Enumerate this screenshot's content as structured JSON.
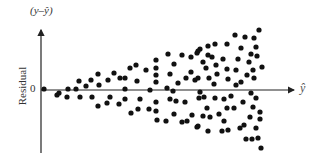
{
  "chart_data": {
    "type": "scatter",
    "title": "",
    "xlabel": "ŷ",
    "ylabel": "Residual",
    "ylabel_top": "(y–ŷ)",
    "y_tick_labels": [
      "0"
    ],
    "grid": false,
    "legend": null,
    "annotation": "Residuals fan out (increasing spread) as ŷ increases — heteroscedasticity pattern",
    "pixel_frame": {
      "x_axis_y": 90,
      "y_axis_x": 41,
      "x_end": 296,
      "y_top": 28,
      "y_bottom": 153
    },
    "points_px": [
      [
        44,
        89
      ],
      [
        57,
        95
      ],
      [
        59,
        93
      ],
      [
        68,
        89
      ],
      [
        67,
        97
      ],
      [
        76,
        89
      ],
      [
        79,
        81
      ],
      [
        80,
        97
      ],
      [
        86,
        86
      ],
      [
        91,
        80
      ],
      [
        92,
        97
      ],
      [
        98,
        74
      ],
      [
        99,
        85
      ],
      [
        98,
        106
      ],
      [
        108,
        80
      ],
      [
        110,
        97
      ],
      [
        107,
        103
      ],
      [
        114,
        73
      ],
      [
        120,
        78
      ],
      [
        125,
        78
      ],
      [
        119,
        104
      ],
      [
        125,
        89
      ],
      [
        125,
        99
      ],
      [
        130,
        68
      ],
      [
        136,
        65
      ],
      [
        137,
        81
      ],
      [
        138,
        109
      ],
      [
        131,
        113
      ],
      [
        140,
        99
      ],
      [
        146,
        70
      ],
      [
        149,
        109
      ],
      [
        150,
        90
      ],
      [
        156,
        60
      ],
      [
        156,
        68
      ],
      [
        156,
        75
      ],
      [
        156,
        82
      ],
      [
        168,
        54
      ],
      [
        174,
        64
      ],
      [
        170,
        74
      ],
      [
        178,
        83
      ],
      [
        182,
        55
      ],
      [
        186,
        78
      ],
      [
        191,
        57
      ],
      [
        191,
        72
      ],
      [
        197,
        53
      ],
      [
        200,
        49
      ],
      [
        195,
        80
      ],
      [
        167,
        88
      ],
      [
        173,
        91
      ],
      [
        156,
        102
      ],
      [
        156,
        111
      ],
      [
        157,
        120
      ],
      [
        170,
        99
      ],
      [
        176,
        101
      ],
      [
        185,
        102
      ],
      [
        199,
        98
      ],
      [
        174,
        114
      ],
      [
        166,
        121
      ],
      [
        182,
        122
      ],
      [
        187,
        121
      ],
      [
        192,
        115
      ],
      [
        197,
        127
      ],
      [
        235,
        35
      ],
      [
        208,
        46
      ],
      [
        215,
        44
      ],
      [
        227,
        44
      ],
      [
        198,
        51
      ],
      [
        208,
        55
      ],
      [
        212,
        57
      ],
      [
        223,
        59
      ],
      [
        238,
        59
      ],
      [
        203,
        62
      ],
      [
        216,
        65
      ],
      [
        206,
        68
      ],
      [
        227,
        69
      ],
      [
        236,
        70
      ],
      [
        198,
        78
      ],
      [
        209,
        78
      ],
      [
        217,
        74
      ],
      [
        228,
        79
      ],
      [
        214,
        84
      ],
      [
        236,
        85
      ],
      [
        200,
        92
      ],
      [
        204,
        97
      ],
      [
        215,
        98
      ],
      [
        224,
        99
      ],
      [
        231,
        96
      ],
      [
        207,
        108
      ],
      [
        227,
        108
      ],
      [
        234,
        108
      ],
      [
        203,
        116
      ],
      [
        210,
        117
      ],
      [
        219,
        114
      ],
      [
        224,
        121
      ],
      [
        198,
        126
      ],
      [
        208,
        131
      ],
      [
        222,
        131
      ],
      [
        228,
        130
      ],
      [
        240,
        128
      ],
      [
        259,
        30
      ],
      [
        245,
        37
      ],
      [
        254,
        38
      ],
      [
        256,
        47
      ],
      [
        241,
        48
      ],
      [
        251,
        54
      ],
      [
        257,
        56
      ],
      [
        249,
        62
      ],
      [
        262,
        67
      ],
      [
        253,
        70
      ],
      [
        247,
        75
      ],
      [
        254,
        78
      ],
      [
        241,
        82
      ],
      [
        251,
        93
      ],
      [
        256,
        98
      ],
      [
        243,
        102
      ],
      [
        253,
        107
      ],
      [
        260,
        112
      ],
      [
        250,
        117
      ],
      [
        260,
        119
      ],
      [
        244,
        125
      ],
      [
        256,
        128
      ],
      [
        246,
        139
      ],
      [
        252,
        139
      ],
      [
        258,
        138
      ],
      [
        261,
        148
      ]
    ],
    "colors": {
      "points": "#111111",
      "axes": "#222222",
      "text": "#333333"
    }
  }
}
